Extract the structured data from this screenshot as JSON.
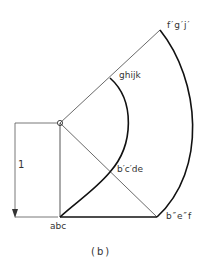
{
  "diagram": {
    "caption": "(b)",
    "dimension_label": "1",
    "points": {
      "center": "o",
      "origin": "abc",
      "mid_diagonal": "b′c′de",
      "inner_arc_top": "ghijk",
      "outer_arc_top": "f′g′j′",
      "outer_arc_bottom": "b″e″f"
    },
    "colors": {
      "line": "#333333",
      "thick_line": "#111111",
      "background": "#ffffff"
    }
  }
}
